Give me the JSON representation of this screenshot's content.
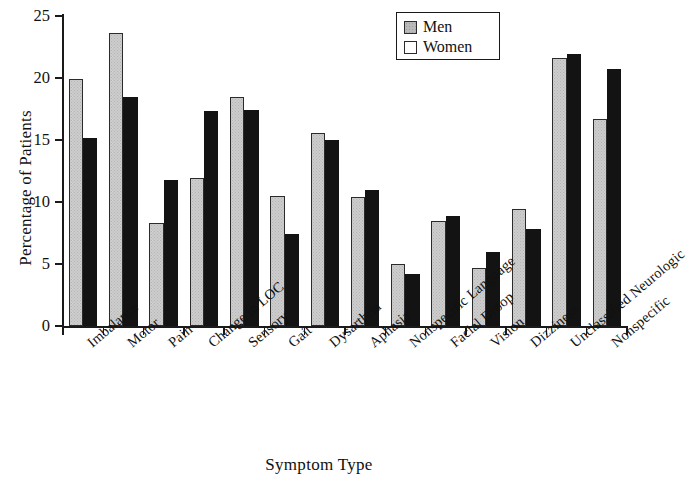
{
  "chart_data": {
    "type": "bar",
    "title": "",
    "xlabel": "Symptom Type",
    "ylabel": "Percentage of Patients",
    "ylim": [
      0,
      25
    ],
    "yticks": [
      0,
      5,
      10,
      15,
      20,
      25
    ],
    "grid": false,
    "legend_position": "top-right",
    "categories": [
      "Imbalance",
      "Motor",
      "Pain",
      "Change in LOC",
      "Sensory",
      "Gait",
      "Dysarthria",
      "Aphasia",
      "Nonspecific Language",
      "Facial Droop",
      "Vision",
      "Dizziness",
      "Unclassified Neurologic",
      "Nonspecific"
    ],
    "series": [
      {
        "name": "Men",
        "color": "#cdcdcd",
        "values": [
          19.9,
          23.6,
          8.3,
          11.9,
          18.5,
          10.5,
          15.6,
          10.4,
          5.0,
          8.5,
          4.7,
          9.4,
          21.6,
          16.7
        ]
      },
      {
        "name": "Women",
        "color": "#131313",
        "values": [
          15.2,
          18.5,
          11.8,
          17.3,
          17.4,
          7.4,
          15.0,
          11.0,
          4.2,
          8.9,
          6.0,
          7.8,
          21.9,
          20.7
        ]
      }
    ]
  },
  "legend": {
    "entries": [
      {
        "label": "Men",
        "swatch": "men"
      },
      {
        "label": "Women",
        "swatch": "women"
      }
    ]
  },
  "axes": {
    "y_title": "Percentage of Patients",
    "x_title": "Symptom Type",
    "y_tick_labels": [
      "0",
      "5",
      "10",
      "15",
      "20",
      "25"
    ]
  }
}
